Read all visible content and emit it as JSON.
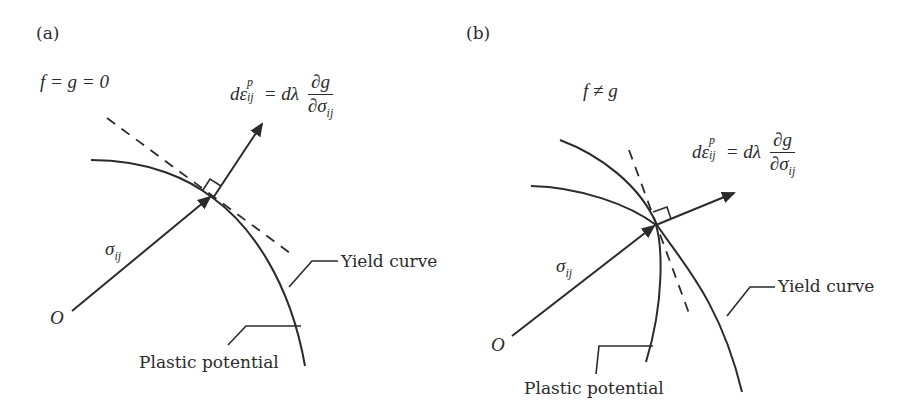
{
  "panels": [
    {
      "id": "a",
      "label": "(a)",
      "condition": "f = g = 0",
      "equation": {
        "lhs_d": "dε",
        "sup": "p",
        "sub": "ij",
        "eq": "= dλ",
        "num": "∂g",
        "den": "∂σ",
        "den_sub": "ij"
      },
      "stress_label": "σ",
      "stress_sub": "ij",
      "origin_label": "O",
      "callouts": {
        "yield": "Yield curve",
        "potential": "Plastic potential"
      }
    },
    {
      "id": "b",
      "label": "(b)",
      "condition": "f ≠ g",
      "equation": {
        "lhs_d": "dε",
        "sup": "p",
        "sub": "ij",
        "eq": "= dλ",
        "num": "∂g",
        "den": "∂σ",
        "den_sub": "ij"
      },
      "stress_label": "σ",
      "stress_sub": "ij",
      "origin_label": "O",
      "callouts": {
        "yield": "Yield curve",
        "potential": "Plastic potential"
      }
    }
  ],
  "colors": {
    "ink": "#2b2b2b",
    "background": "#ffffff"
  }
}
